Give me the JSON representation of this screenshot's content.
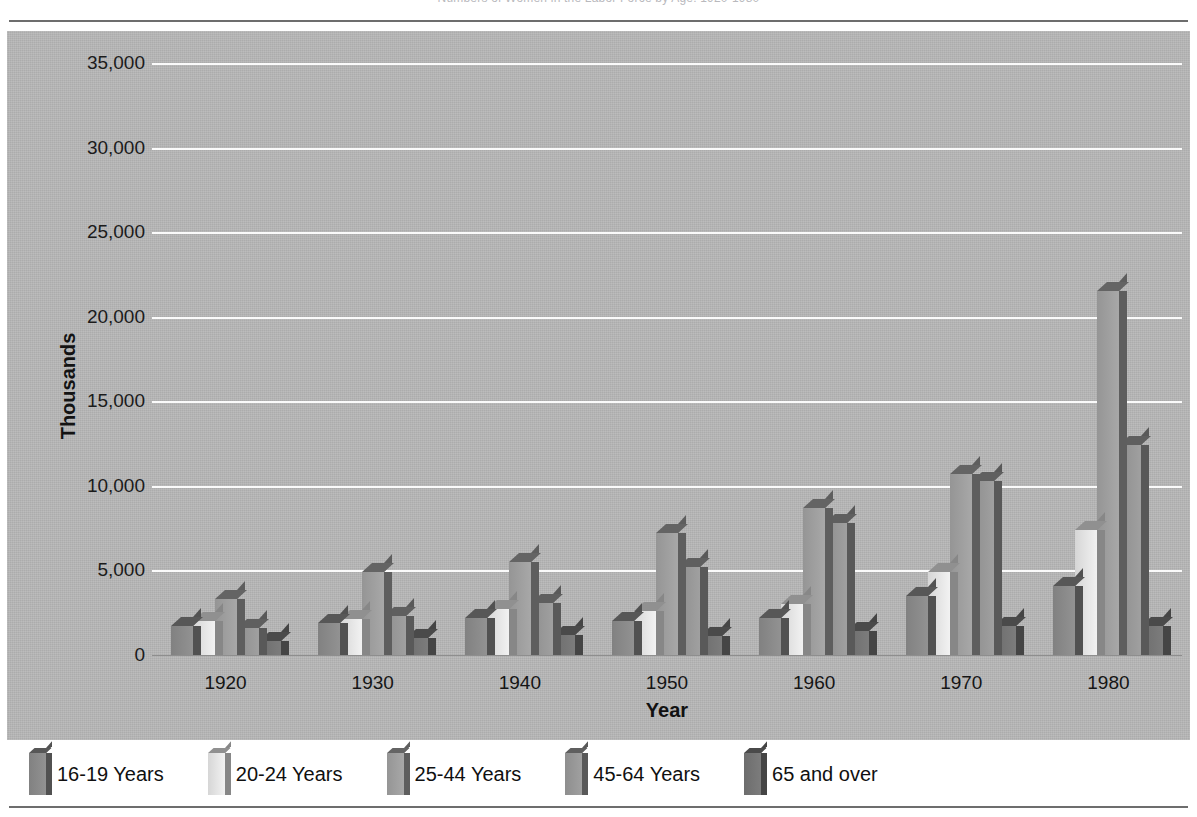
{
  "figure": {
    "title": "Numbers of Women in the Labor Force by Age: 1920-1980",
    "title_clipped": true
  },
  "chart_data": {
    "type": "bar",
    "title": "Numbers of Women in the Labor Force by Age: 1920-1980",
    "xlabel": "Year",
    "ylabel": "Thousands",
    "categories": [
      "1920",
      "1930",
      "1940",
      "1950",
      "1960",
      "1970",
      "1980"
    ],
    "ylim": [
      0,
      35000
    ],
    "yticks": [
      0,
      5000,
      10000,
      15000,
      20000,
      25000,
      30000,
      35000
    ],
    "ytick_labels": [
      "0",
      "5,000",
      "10,000",
      "15,000",
      "20,000",
      "25,000",
      "30,000",
      "35,000"
    ],
    "grid": true,
    "grid_color": "#fbfbfb",
    "legend_position": "bottom",
    "style": "3d-clustered-column",
    "plot_background": "#b8b8b8",
    "series": [
      {
        "name": "16-19 Years",
        "color": "#8c8c8c",
        "values": [
          1700,
          1900,
          2200,
          2000,
          2200,
          3500,
          4100
        ]
      },
      {
        "name": "20-24 Years",
        "color": "#e9e9e9",
        "values": [
          2000,
          2100,
          2700,
          2600,
          3000,
          4900,
          7400
        ]
      },
      {
        "name": "25-44 Years",
        "color": "#a2a2a2",
        "values": [
          3300,
          4900,
          5500,
          7200,
          8700,
          10700,
          21500
        ]
      },
      {
        "name": "45-64 Years",
        "color": "#9a9a9a",
        "values": [
          1600,
          2300,
          3100,
          5200,
          7800,
          10300,
          12400
        ]
      },
      {
        "name": "65 and over",
        "color": "#777777",
        "values": [
          800,
          1000,
          1200,
          1100,
          1400,
          1700,
          1700
        ]
      }
    ]
  },
  "legend": {
    "items": [
      {
        "label": "16-19 Years",
        "color": "#8c8c8c"
      },
      {
        "label": "20-24 Years",
        "color": "#e9e9e9"
      },
      {
        "label": "25-44 Years",
        "color": "#a2a2a2"
      },
      {
        "label": "45-64 Years",
        "color": "#9a9a9a"
      },
      {
        "label": "65 and over",
        "color": "#777777"
      }
    ]
  }
}
